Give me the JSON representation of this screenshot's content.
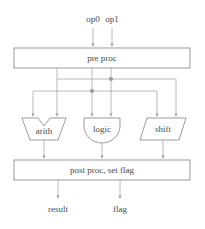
{
  "diagram": {
    "width": 205,
    "height": 229,
    "colors": {
      "background": "#ffffff",
      "stroke": "#8f8f8f",
      "wire": "#a8a8a8",
      "text": "#4a4a4a",
      "junction": "#9a9a9a"
    },
    "inputs": [
      {
        "label": "op0",
        "x": 93,
        "y": 20
      },
      {
        "label": "op1",
        "x": 112,
        "y": 20
      }
    ],
    "blocks": [
      {
        "id": "pre-proc",
        "label": "pre proc",
        "shape": "rect",
        "x": 14,
        "y": 48,
        "width": 176,
        "height": 20
      },
      {
        "id": "arith",
        "label": "arith",
        "shape": "alu",
        "x": 22,
        "y": 118,
        "width": 44,
        "height": 22
      },
      {
        "id": "logic",
        "label": "logic",
        "shape": "dshape",
        "x": 84,
        "y": 118,
        "width": 36,
        "height": 25
      },
      {
        "id": "shift",
        "label": "shift",
        "shape": "parallelogram",
        "x": 140,
        "y": 118,
        "width": 46,
        "height": 22
      },
      {
        "id": "post-proc",
        "label": "post proc, set flag",
        "shape": "rect",
        "x": 14,
        "y": 160,
        "width": 176,
        "height": 20
      }
    ],
    "outputs": [
      {
        "label": "result",
        "x": 58,
        "y": 210
      },
      {
        "label": "flag",
        "x": 120,
        "y": 210
      }
    ],
    "junctions": [
      {
        "x": 111,
        "y": 79
      },
      {
        "x": 92,
        "y": 91
      }
    ],
    "edges": [
      {
        "from": "op0",
        "to": "pre-proc"
      },
      {
        "from": "op1",
        "to": "pre-proc"
      },
      {
        "from": "pre-proc",
        "to": "arith"
      },
      {
        "from": "pre-proc",
        "to": "logic"
      },
      {
        "from": "pre-proc",
        "to": "shift"
      },
      {
        "from": "arith",
        "to": "post-proc"
      },
      {
        "from": "logic",
        "to": "post-proc"
      },
      {
        "from": "shift",
        "to": "post-proc"
      },
      {
        "from": "post-proc",
        "to": "result"
      },
      {
        "from": "post-proc",
        "to": "flag"
      }
    ]
  }
}
